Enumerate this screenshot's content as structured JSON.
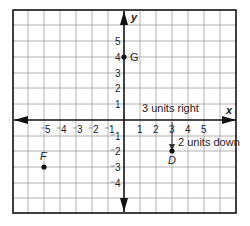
{
  "diagram": {
    "type": "coordinate-grid",
    "axes": {
      "x_label": "x",
      "y_label": "y"
    },
    "x_ticks": [
      "⁻5",
      "⁻4",
      "⁻3",
      "⁻2",
      "⁻1",
      "1",
      "2",
      "3",
      "4",
      "5"
    ],
    "y_ticks_pos": [
      "5",
      "4",
      "3",
      "2",
      "1"
    ],
    "y_ticks_neg": [
      "⁻1",
      "⁻2",
      "⁻3",
      "⁻4"
    ],
    "points": [
      {
        "name": "G",
        "x": 0,
        "y": 4
      },
      {
        "name": "D",
        "x": 3,
        "y": -2
      },
      {
        "name": "F",
        "x": -5,
        "y": -3
      }
    ],
    "annotations": {
      "right": "3 units right",
      "down": "2 units down"
    },
    "colors": {
      "grid": "#999999",
      "axis": "#111111",
      "point": "#111111"
    }
  }
}
